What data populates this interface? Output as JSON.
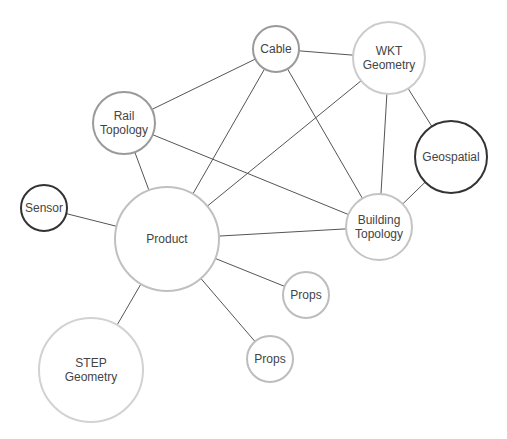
{
  "diagram": {
    "type": "network-graph",
    "nodes": [
      {
        "id": "rail_topology",
        "label_lines": [
          "Rail",
          "Topology"
        ],
        "x": 124,
        "y": 123,
        "r": 31,
        "stroke": "#9a9a9a",
        "stroke_width": 2
      },
      {
        "id": "cable",
        "label_lines": [
          "Cable"
        ],
        "x": 276,
        "y": 49,
        "r": 23,
        "stroke": "#999999",
        "stroke_width": 2
      },
      {
        "id": "wkt_geometry",
        "label_lines": [
          "WKT",
          "Geometry"
        ],
        "x": 389,
        "y": 58,
        "r": 36,
        "stroke": "#cccccc",
        "stroke_width": 2
      },
      {
        "id": "geospatial",
        "label_lines": [
          "Geospatial"
        ],
        "x": 451,
        "y": 157,
        "r": 36,
        "stroke": "#333333",
        "stroke_width": 2
      },
      {
        "id": "building_topology",
        "label_lines": [
          "Building",
          "Topology"
        ],
        "x": 379,
        "y": 227,
        "r": 33,
        "stroke": "#c4c4c4",
        "stroke_width": 2
      },
      {
        "id": "sensor",
        "label_lines": [
          "Sensor"
        ],
        "x": 44,
        "y": 208,
        "r": 23,
        "stroke": "#333333",
        "stroke_width": 2
      },
      {
        "id": "product",
        "label_lines": [
          "Product"
        ],
        "x": 167,
        "y": 239,
        "r": 52,
        "stroke": "#c0c0c0",
        "stroke_width": 2
      },
      {
        "id": "props_1",
        "label_lines": [
          "Props"
        ],
        "x": 306,
        "y": 295,
        "r": 23,
        "stroke": "#bdbdbd",
        "stroke_width": 2
      },
      {
        "id": "props_2",
        "label_lines": [
          "Props"
        ],
        "x": 270,
        "y": 359,
        "r": 23,
        "stroke": "#bdbdbd",
        "stroke_width": 2
      },
      {
        "id": "step_geometry",
        "label_lines": [
          "STEP",
          "Geometry"
        ],
        "x": 91,
        "y": 370,
        "r": 52,
        "stroke": "#d2d2d2",
        "stroke_width": 2
      }
    ],
    "edges": [
      [
        "rail_topology",
        "cable"
      ],
      [
        "rail_topology",
        "product"
      ],
      [
        "rail_topology",
        "building_topology"
      ],
      [
        "cable",
        "wkt_geometry"
      ],
      [
        "cable",
        "product"
      ],
      [
        "cable",
        "building_topology"
      ],
      [
        "wkt_geometry",
        "product"
      ],
      [
        "wkt_geometry",
        "building_topology"
      ],
      [
        "wkt_geometry",
        "geospatial"
      ],
      [
        "geospatial",
        "building_topology"
      ],
      [
        "sensor",
        "product"
      ],
      [
        "product",
        "building_topology"
      ],
      [
        "product",
        "props_1"
      ],
      [
        "product",
        "props_2"
      ],
      [
        "product",
        "step_geometry"
      ]
    ]
  }
}
